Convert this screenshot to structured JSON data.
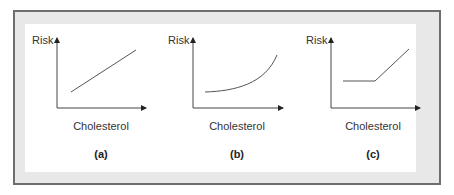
{
  "figure": {
    "panels": [
      {
        "id": "a",
        "ylabel": "Risk",
        "xlabel": "Cholesterol",
        "caption": "(a)",
        "shape": "linear"
      },
      {
        "id": "b",
        "ylabel": "Risk",
        "xlabel": "Cholesterol",
        "caption": "(b)",
        "shape": "exponential"
      },
      {
        "id": "c",
        "ylabel": "Risk",
        "xlabel": "Cholesterol",
        "caption": "(c)",
        "shape": "threshold"
      }
    ]
  },
  "colors": {
    "frame": "#6e6e6e",
    "band": "#e8e8e8",
    "line": "#555555"
  }
}
